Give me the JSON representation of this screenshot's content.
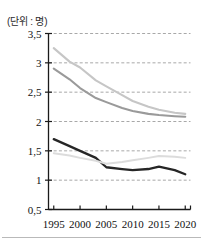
{
  "unit_label": "(단위 : 명)",
  "axis": {
    "y_ticks": [
      "3,5",
      "3",
      "2,5",
      "2",
      "1,5",
      "1",
      "0,5"
    ],
    "x_ticks": [
      "1995",
      "2000",
      "2005",
      "2010",
      "2015",
      "2020"
    ]
  },
  "colors": {
    "series_light_gray": "#c6c6c6",
    "series_mid_gray": "#9a9a9a",
    "series_dark": "#262626",
    "series_pale": "#dcdcdc",
    "gridline": "#9e9e9e",
    "axis": "#1a1a1a",
    "rule": "#b9b9b9"
  },
  "chart_data": {
    "type": "line",
    "title": "",
    "subtitle": "",
    "xlabel": "",
    "ylabel": "",
    "unit": "명",
    "x": [
      1995,
      1998,
      2000,
      2003,
      2005,
      2008,
      2010,
      2013,
      2015,
      2018,
      2020
    ],
    "xlim": [
      1994,
      2021
    ],
    "ylim": [
      0.5,
      3.5
    ],
    "yticks": [
      0.5,
      1,
      1.5,
      2,
      2.5,
      3,
      3.5
    ],
    "xticks": [
      1995,
      2000,
      2005,
      2010,
      2015,
      2020
    ],
    "grid": true,
    "grid_style": "dashed",
    "legend": "none",
    "series": [
      {
        "name": "series-1",
        "color": "#c6c6c6",
        "values": [
          3.25,
          3.02,
          2.92,
          2.7,
          2.6,
          2.45,
          2.35,
          2.25,
          2.2,
          2.15,
          2.13
        ]
      },
      {
        "name": "series-2",
        "color": "#9a9a9a",
        "values": [
          2.9,
          2.72,
          2.57,
          2.4,
          2.33,
          2.23,
          2.18,
          2.13,
          2.11,
          2.09,
          2.08
        ]
      },
      {
        "name": "series-3",
        "color": "#262626",
        "values": [
          1.7,
          1.58,
          1.5,
          1.38,
          1.22,
          1.19,
          1.17,
          1.19,
          1.23,
          1.17,
          1.1
        ]
      },
      {
        "name": "series-4",
        "color": "#dcdcdc",
        "values": [
          1.46,
          1.42,
          1.38,
          1.33,
          1.28,
          1.31,
          1.34,
          1.38,
          1.41,
          1.4,
          1.38
        ]
      }
    ]
  }
}
